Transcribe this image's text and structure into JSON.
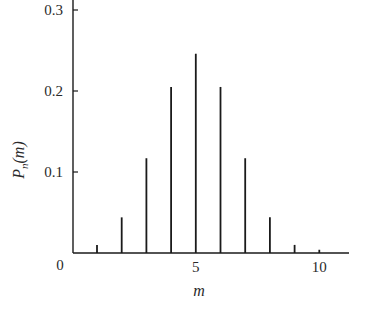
{
  "chart_data": {
    "type": "bar",
    "title": "",
    "xlabel": "m",
    "ylabel": "P_n(m)",
    "ylabel_main": "P",
    "ylabel_sub": "n",
    "ylabel_arg": "(m)",
    "x": [
      1,
      2,
      3,
      4,
      5,
      6,
      7,
      8,
      9,
      10
    ],
    "values": [
      0.01,
      0.044,
      0.117,
      0.205,
      0.246,
      0.205,
      0.117,
      0.044,
      0.01,
      0.004
    ],
    "xlim": [
      0,
      11
    ],
    "ylim": [
      0,
      0.3
    ],
    "x_ticks": [
      {
        "value": 0,
        "label": "0"
      },
      {
        "value": 5,
        "label": "5"
      },
      {
        "value": 10,
        "label": "10"
      }
    ],
    "y_ticks": [
      {
        "value": 0.1,
        "label": "0.1"
      },
      {
        "value": 0.2,
        "label": "0.2"
      },
      {
        "value": 0.3,
        "label": "0.3"
      }
    ],
    "grid": false,
    "legend": null,
    "style": "stem",
    "color": "#1a1a1a"
  }
}
